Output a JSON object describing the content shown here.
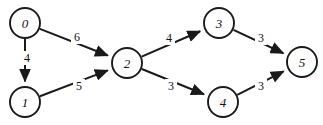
{
  "diagram": {
    "type": "directed-weighted-graph",
    "width": 323,
    "height": 125,
    "background_color": "#ffffff",
    "stroke_color": "#1a1a1a",
    "text_color": "#111111",
    "node_radius": 15,
    "nodes": [
      {
        "id": "0",
        "label": "0",
        "x": 25,
        "y": 23
      },
      {
        "id": "1",
        "label": "1",
        "x": 25,
        "y": 102
      },
      {
        "id": "2",
        "label": "2",
        "x": 127,
        "y": 63
      },
      {
        "id": "3",
        "label": "3",
        "x": 219,
        "y": 23
      },
      {
        "id": "4",
        "label": "4",
        "x": 223,
        "y": 102
      },
      {
        "id": "5",
        "label": "5",
        "x": 302,
        "y": 62
      }
    ],
    "edges": [
      {
        "id": "e01",
        "from": "0",
        "to": "1",
        "weight": "4",
        "label_x": 27,
        "label_y": 58
      },
      {
        "id": "e02",
        "from": "0",
        "to": "2",
        "weight": "6",
        "label_x": 77,
        "label_y": 37
      },
      {
        "id": "e12",
        "from": "1",
        "to": "2",
        "weight": "5",
        "label_x": 79,
        "label_y": 86
      },
      {
        "id": "e23",
        "from": "2",
        "to": "3",
        "weight": "4",
        "label_x": 169,
        "label_y": 38
      },
      {
        "id": "e24",
        "from": "2",
        "to": "4",
        "weight": "3",
        "label_x": 171,
        "label_y": 86
      },
      {
        "id": "e35",
        "from": "3",
        "to": "5",
        "weight": "3",
        "label_x": 261,
        "label_y": 38
      },
      {
        "id": "e45",
        "from": "4",
        "to": "5",
        "weight": "3",
        "label_x": 261,
        "label_y": 86
      }
    ]
  }
}
